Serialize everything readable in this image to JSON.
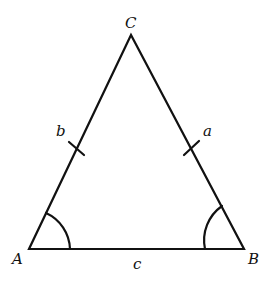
{
  "figure": {
    "type": "isosceles-triangle",
    "vertices": [
      {
        "label": "A",
        "x": 29,
        "y": 249
      },
      {
        "label": "B",
        "x": 244,
        "y": 249
      },
      {
        "label": "C",
        "x": 131,
        "y": 35
      }
    ],
    "sides": [
      {
        "label": "a",
        "between": "B-C",
        "tick_marks": 1
      },
      {
        "label": "b",
        "between": "A-C",
        "tick_marks": 1
      },
      {
        "label": "c",
        "between": "A-B",
        "tick_marks": 0
      }
    ],
    "angle_arcs": [
      "A",
      "B"
    ],
    "line_color": "#111111"
  },
  "labels": {
    "C": "C",
    "A": "A",
    "B": "B",
    "a": "a",
    "b": "b",
    "c": "c"
  }
}
